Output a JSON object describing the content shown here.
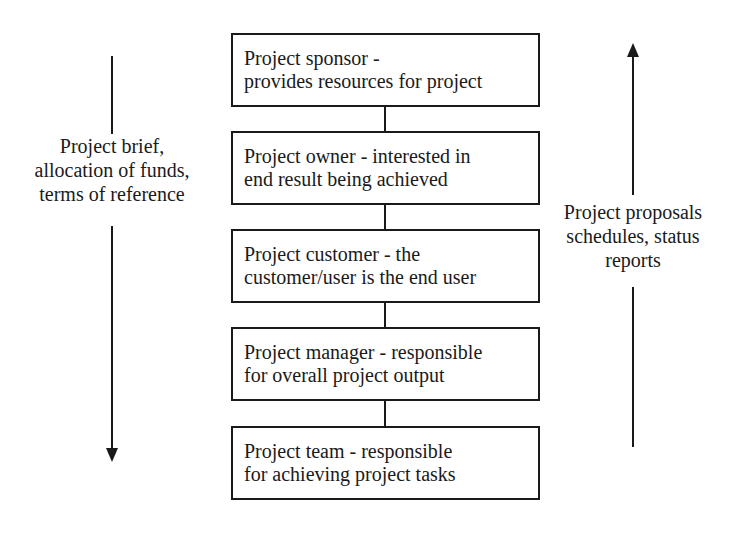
{
  "diagram": {
    "boxes": [
      {
        "line1": "Project sponsor -",
        "line2": "provides resources for project"
      },
      {
        "line1": "Project owner - interested in",
        "line2": "end result being achieved"
      },
      {
        "line1": "Project customer - the",
        "line2": "customer/user is the end user"
      },
      {
        "line1": "Project manager - responsible",
        "line2": "for overall project output"
      },
      {
        "line1": "Project team - responsible",
        "line2": "for achieving project tasks"
      }
    ],
    "left_flow": {
      "direction": "down",
      "lines": [
        "Project brief,",
        "allocation of funds,",
        "terms of reference"
      ]
    },
    "right_flow": {
      "direction": "up",
      "lines": [
        "Project proposals",
        "schedules, status",
        "reports"
      ]
    },
    "colors": {
      "line": "#1a1a1a",
      "background": "#ffffff"
    }
  }
}
